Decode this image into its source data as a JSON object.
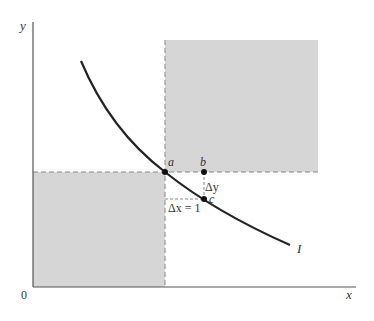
{
  "diagram": {
    "axes": {
      "y_label": "y",
      "x_label": "x",
      "origin_label": "0"
    },
    "points": {
      "a": "a",
      "b": "b",
      "c": "c"
    },
    "annotations": {
      "delta_y": "Δy",
      "delta_x": "Δx = 1"
    },
    "curve_label": "I",
    "colors": {
      "shade": "#d6d6d6",
      "curve": "#222222",
      "axis": "#555555",
      "dash": "#888888"
    }
  }
}
